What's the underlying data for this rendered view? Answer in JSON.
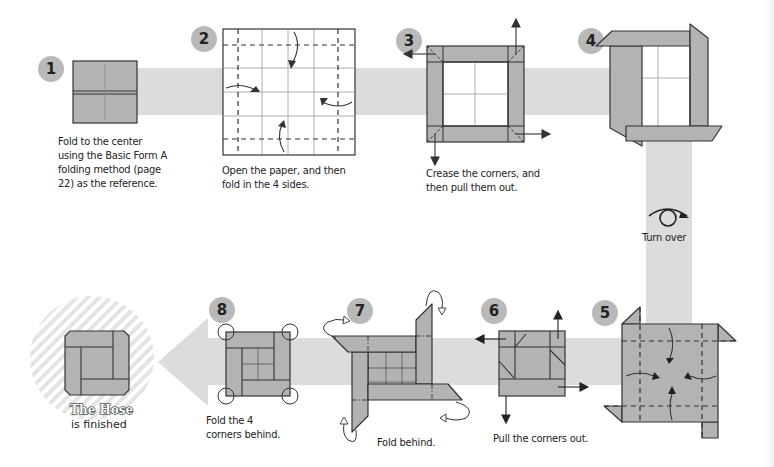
{
  "colors": {
    "band": "#dcdcdc",
    "paper_shade": "#b3b3b3",
    "paper_light": "#ffffff",
    "line": "#333333",
    "step_badge": "#b9b9b9",
    "hatch": "#e4e4e4"
  },
  "steps": [
    {
      "number": "1",
      "caption": [
        "Fold to the center",
        "using the Basic Form A",
        "folding method (page",
        "22) as the reference."
      ]
    },
    {
      "number": "2",
      "caption": [
        "Open the paper, and then",
        "fold in the 4 sides."
      ]
    },
    {
      "number": "3",
      "caption": [
        "Crease the corners, and",
        "then pull them out."
      ]
    },
    {
      "number": "4",
      "caption": []
    },
    {
      "number": "5",
      "caption": []
    },
    {
      "number": "6",
      "caption": [
        "Pull the corners out."
      ]
    },
    {
      "number": "7",
      "caption": [
        "Fold behind."
      ]
    },
    {
      "number": "8",
      "caption": [
        "Fold the 4",
        "corners behind."
      ]
    }
  ],
  "turn_over": {
    "label": "Turn over",
    "icon": "turn-over-icon"
  },
  "finished": {
    "title": "The Hose",
    "subtitle": "is finished"
  }
}
